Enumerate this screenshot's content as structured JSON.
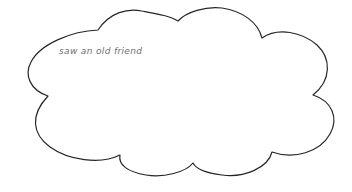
{
  "page": {
    "background_color": "#ffffff",
    "width": 352,
    "height": 192
  },
  "cloud": {
    "shape_name": "thought-cloud-outline",
    "stroke_color": "#262626",
    "fill_color": "#ffffff",
    "stroke_width": 1.2,
    "caption": {
      "text": "saw an old friend",
      "color": "#6f6f6f",
      "style": "italic",
      "font_size_px": 9
    }
  },
  "icons": {
    "cloud": "cloud-outline-icon"
  }
}
